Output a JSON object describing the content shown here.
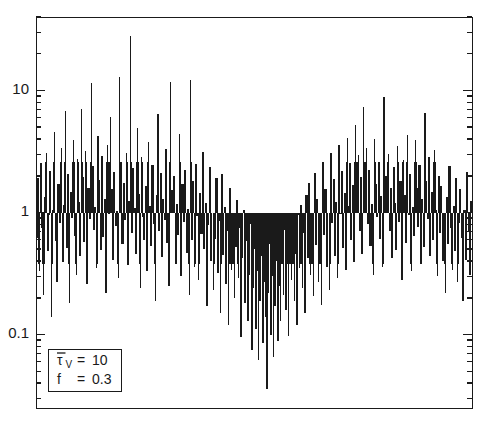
{
  "figure": {
    "background_color": "#ffffff",
    "ink_color": "#1a1a1a",
    "frame": {
      "left": 36,
      "top": 17,
      "right": 472,
      "bottom": 408
    }
  },
  "axes": {
    "y": {
      "scale": "log",
      "tick_labels": [
        "10",
        "1",
        "0.1"
      ],
      "tick_values": [
        10,
        1,
        0.1
      ],
      "minor_ticks_per_decade": [
        2,
        3,
        4,
        5,
        6,
        7,
        8,
        9
      ],
      "limits": [
        0.025,
        40
      ],
      "ticks_inward": true,
      "label": ""
    },
    "x": {
      "scale": "linear",
      "tick_labels": [],
      "limits": [
        0,
        1
      ],
      "label": ""
    }
  },
  "legend": {
    "box": {
      "left": 48,
      "top": 349,
      "width": 73,
      "height": 42
    },
    "rows": [
      {
        "symbol": "τ",
        "overbar": true,
        "subscript": "V",
        "equals": "=",
        "value": "10"
      },
      {
        "symbol": "f",
        "overbar": false,
        "subscript": "",
        "equals": "=",
        "value": "0.3"
      }
    ]
  },
  "chart_data": {
    "type": "line",
    "title": "",
    "xlabel": "",
    "ylabel": "",
    "yscale": "log",
    "ylim": [
      0.025,
      40
    ],
    "xlim": [
      0,
      1
    ],
    "grid": false,
    "legend_position": "lower-left",
    "series": [
      {
        "name": "intensity-spike-train",
        "style": "vertical-spikes",
        "description": "Dense stochastic spike train of ~195 vertical lines; amplitudes modulated by a slow envelope with maxima near x=0.15 and x=0.85 and a deep minimum near x=0.55.",
        "values": [
          0.62,
          1.9,
          0.33,
          2.55,
          0.74,
          0.21,
          1.35,
          3.1,
          0.48,
          0.95,
          2.2,
          0.14,
          1.05,
          4.6,
          0.58,
          0.27,
          1.7,
          0.82,
          3.4,
          0.39,
          1.15,
          6.8,
          0.51,
          2.05,
          0.18,
          1.48,
          0.9,
          3.95,
          0.64,
          0.31,
          2.75,
          1.22,
          0.44,
          7.1,
          1.95,
          0.57,
          3.2,
          0.26,
          1.6,
          0.88,
          11.5,
          2.4,
          0.72,
          1.1,
          0.35,
          4.2,
          1.85,
          0.49,
          2.9,
          0.63,
          1.3,
          0.22,
          3.6,
          0.97,
          6.1,
          1.55,
          0.41,
          2.15,
          0.78,
          1.02,
          0.29,
          13.0,
          2.6,
          0.55,
          1.75,
          0.86,
          3.05,
          0.37,
          1.25,
          28.0,
          0.68,
          2.3,
          1.08,
          0.46,
          4.9,
          1.42,
          0.24,
          2.85,
          0.92,
          0.6,
          1.65,
          0.33,
          3.75,
          1.12,
          0.53,
          2.45,
          0.81,
          0.19,
          1.38,
          6.4,
          0.71,
          2.1,
          0.43,
          1.28,
          0.87,
          3.3,
          0.56,
          0.25,
          11.8,
          1.52,
          0.99,
          2.0,
          0.38,
          1.18,
          0.65,
          4.4,
          0.3,
          1.72,
          0.84,
          2.25,
          0.47,
          1.06,
          0.21,
          12.2,
          0.59,
          1.8,
          0.36,
          2.5,
          0.93,
          0.28,
          1.44,
          0.67,
          3.15,
          0.5,
          1.2,
          0.17,
          0.79,
          2.35,
          0.4,
          1.0,
          0.23,
          0.61,
          1.9,
          0.32,
          0.85,
          0.15,
          2.05,
          0.45,
          1.1,
          0.26,
          0.7,
          0.12,
          1.58,
          0.34,
          0.88,
          0.2,
          0.52,
          1.26,
          0.29,
          0.75,
          0.095,
          0.42,
          1.05,
          0.18,
          0.58,
          0.13,
          0.31,
          0.8,
          0.075,
          0.24,
          0.5,
          0.11,
          0.33,
          0.062,
          0.19,
          0.44,
          0.085,
          0.27,
          0.14,
          0.036,
          0.22,
          0.55,
          0.1,
          0.3,
          0.066,
          0.17,
          0.4,
          0.089,
          0.25,
          0.13,
          0.48,
          0.21,
          0.72,
          0.16,
          0.38,
          0.098,
          0.6,
          0.28,
          0.83,
          0.19,
          0.46,
          0.12,
          0.95,
          0.35,
          1.15,
          0.24,
          0.68,
          0.15,
          1.4,
          0.42,
          1.75,
          0.31,
          0.9,
          0.205,
          2.1,
          0.54,
          1.3,
          0.27,
          0.78,
          0.175,
          2.6,
          0.66,
          1.55,
          0.36,
          1.0,
          0.23,
          3.05,
          0.82,
          1.88,
          0.44,
          1.22,
          0.29,
          3.55,
          0.97,
          2.2,
          0.51,
          1.45,
          0.34,
          4.1,
          1.12,
          2.55,
          0.59,
          1.68,
          0.39,
          5.2,
          1.3,
          2.95,
          0.7,
          1.95,
          0.46,
          7.3,
          1.5,
          3.4,
          0.8,
          2.25,
          0.53,
          1.18,
          0.31,
          4.0,
          1.72,
          0.92,
          2.6,
          0.61,
          1.36,
          0.36,
          8.9,
          2.0,
          1.05,
          3.0,
          0.71,
          1.58,
          0.42,
          2.35,
          1.2,
          0.49,
          3.5,
          0.83,
          1.82,
          0.28,
          2.7,
          1.38,
          0.56,
          4.3,
          0.95,
          2.08,
          0.33,
          1.1,
          0.64,
          3.9,
          1.58,
          0.76,
          2.45,
          0.38,
          1.28,
          0.52,
          6.5,
          1.8,
          0.88,
          2.85,
          0.44,
          1.48,
          0.6,
          3.25,
          1.05,
          0.3,
          2.0,
          0.68,
          1.65,
          0.4,
          0.92,
          0.22,
          1.35,
          0.55,
          2.4,
          0.75,
          0.34,
          1.12,
          0.48,
          1.9,
          0.27,
          0.82,
          1.55,
          0.62,
          0.19,
          1.05,
          0.41,
          2.15,
          0.7,
          0.31,
          1.25
        ]
      }
    ]
  }
}
